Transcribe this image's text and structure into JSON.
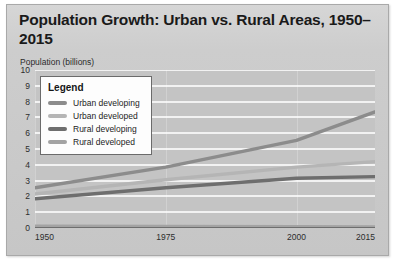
{
  "card": {
    "background": "#c9c9c9",
    "border_color": "#a9a9a9"
  },
  "chart_data": {
    "type": "line",
    "title": "Population Growth: Urban vs. Rural Areas, 1950–2015",
    "subtitle": "",
    "xlabel": "",
    "ylabel": "Population (billions)",
    "x": [
      1950,
      1975,
      2000,
      2015
    ],
    "xlim": [
      1950,
      2015
    ],
    "ylim": [
      0,
      10
    ],
    "ytick_labels": [
      "0",
      "1",
      "2",
      "3",
      "4",
      "5",
      "6",
      "7",
      "8",
      "9",
      "10"
    ],
    "ytick_values": [
      0,
      1,
      2,
      3,
      4,
      5,
      6,
      7,
      8,
      9,
      10
    ],
    "xtick_labels": [
      "1950",
      "1975",
      "2000",
      "2015"
    ],
    "xtick_values": [
      1950,
      1975,
      2000,
      2015
    ],
    "grid": true,
    "grid_color": "#f2f2f2",
    "plot_background": "#c4c4c4",
    "legend_position": "top-left",
    "legend_title": "Legend",
    "series": [
      {
        "name": "Urban developing",
        "color": "#8c8c8c",
        "values": [
          2.55,
          3.85,
          5.55,
          7.35
        ]
      },
      {
        "name": "Urban developed",
        "color": "#b5b5b5",
        "values": [
          2.15,
          3.05,
          3.85,
          4.2
        ]
      },
      {
        "name": "Rural developing",
        "color": "#6e6e6e",
        "values": [
          1.85,
          2.55,
          3.15,
          3.25
        ]
      },
      {
        "name": "Rural developed",
        "color": "#a3a3a3",
        "values": [
          0.12,
          0.1,
          0.08,
          0.07
        ]
      }
    ]
  },
  "legend": {
    "title": "Legend",
    "items": [
      {
        "label": "Urban developing",
        "color": "#8c8c8c"
      },
      {
        "label": "Urban developed",
        "color": "#b5b5b5"
      },
      {
        "label": "Rural developing",
        "color": "#6e6e6e"
      },
      {
        "label": "Rural developed",
        "color": "#a3a3a3"
      }
    ]
  }
}
